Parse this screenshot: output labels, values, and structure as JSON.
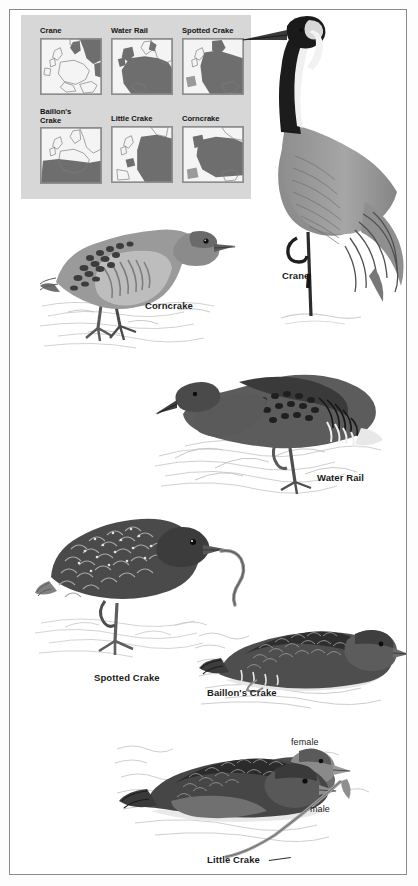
{
  "plate": {
    "title": "European rails, crakes and crane identification plate",
    "border_color": "#8a8a8a",
    "background": "#ffffff"
  },
  "map_panel": {
    "background": "#d7d7d7",
    "range_color": "#6e6e6e",
    "land_color": "#f4f4f4",
    "outline_color": "#8d8d8d",
    "region": "Europe",
    "maps": [
      {
        "title": "Crane",
        "row": 1,
        "col": 1
      },
      {
        "title": "Water Rail",
        "row": 1,
        "col": 2
      },
      {
        "title": "Spotted Crake",
        "row": 1,
        "col": 3
      },
      {
        "title": "Baillon's\nCrake",
        "title_line1": "Baillon's",
        "title_line2": "Crake",
        "row": 2,
        "col": 1
      },
      {
        "title": "Little Crake",
        "row": 2,
        "col": 2
      },
      {
        "title": "Corncrake",
        "row": 2,
        "col": 3
      }
    ]
  },
  "illustrations": [
    {
      "name": "crane",
      "label": "Crane",
      "label_x": 272,
      "label_y": 261,
      "sex": null
    },
    {
      "name": "corncrake",
      "label": "Corncrake",
      "label_x": 135,
      "label_y": 291,
      "sex": null
    },
    {
      "name": "water-rail",
      "label": "Water Rail",
      "label_x": 307,
      "label_y": 463,
      "sex": null
    },
    {
      "name": "spotted-crake",
      "label": "Spotted Crake",
      "label_x": 84,
      "label_y": 663,
      "sex": null
    },
    {
      "name": "baillons-crake",
      "label": "Baillon's Crake",
      "label_x": 197,
      "label_y": 678,
      "sex": null
    },
    {
      "name": "little-crake",
      "label": "Little Crake",
      "label_x": 197,
      "label_y": 845,
      "sex": null
    }
  ],
  "sex_labels": [
    {
      "text": "female",
      "x": 281,
      "y": 728
    },
    {
      "text": "male",
      "x": 300,
      "y": 795
    }
  ],
  "colors": {
    "ink": "#1b1b1b",
    "plumage_dark": "#3d3d3d",
    "plumage_mid": "#6b6b6b",
    "plumage_light": "#a8a8a8",
    "water": "#cfcfcf",
    "ground": "#e8e8e8"
  }
}
